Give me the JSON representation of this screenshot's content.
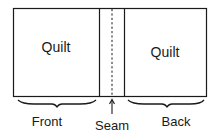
{
  "diagram": {
    "panels": [
      {
        "id": "front-panel",
        "label": "Quilt"
      },
      {
        "id": "back-panel",
        "label": "Quilt"
      }
    ],
    "labels": {
      "front": "Front",
      "seam": "Seam",
      "back": "Back"
    },
    "colors": {
      "stroke": "#1a1a1a",
      "background": "#ffffff"
    }
  }
}
